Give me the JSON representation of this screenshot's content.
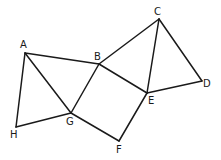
{
  "diagram": {
    "type": "geometry",
    "vertices": [
      {
        "id": "A",
        "label": "A",
        "x": 25,
        "y": 53,
        "lx": 20,
        "ly": 48
      },
      {
        "id": "B",
        "label": "B",
        "x": 99,
        "y": 64,
        "lx": 94,
        "ly": 60
      },
      {
        "id": "C",
        "label": "C",
        "x": 159,
        "y": 19,
        "lx": 154,
        "ly": 15
      },
      {
        "id": "D",
        "label": "D",
        "x": 202,
        "y": 81,
        "lx": 203,
        "ly": 87
      },
      {
        "id": "E",
        "label": "E",
        "x": 147,
        "y": 93,
        "lx": 148,
        "ly": 104
      },
      {
        "id": "F",
        "label": "F",
        "x": 119,
        "y": 141,
        "lx": 116,
        "ly": 153
      },
      {
        "id": "G",
        "label": "G",
        "x": 71,
        "y": 113,
        "lx": 66,
        "ly": 125
      },
      {
        "id": "H",
        "label": "H",
        "x": 16,
        "y": 127,
        "lx": 10,
        "ly": 138
      }
    ],
    "edges": [
      [
        "A",
        "B"
      ],
      [
        "A",
        "G"
      ],
      [
        "A",
        "H"
      ],
      [
        "H",
        "G"
      ],
      [
        "G",
        "B"
      ],
      [
        "B",
        "C"
      ],
      [
        "B",
        "E"
      ],
      [
        "C",
        "E"
      ],
      [
        "C",
        "D"
      ],
      [
        "D",
        "E"
      ],
      [
        "E",
        "F"
      ],
      [
        "F",
        "G"
      ]
    ],
    "stroke_color": "#1a1a1a",
    "background": "#ffffff"
  },
  "labels": {
    "A": "A",
    "B": "B",
    "C": "C",
    "D": "D",
    "E": "E",
    "F": "F",
    "G": "G",
    "H": "H"
  }
}
